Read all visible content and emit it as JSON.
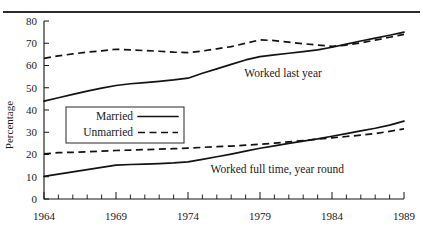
{
  "figure": {
    "title": "",
    "title_clipped": true,
    "has_top_rule": true
  },
  "chart_data": {
    "type": "line",
    "title": "",
    "xlabel": "",
    "ylabel": "Percentage",
    "xlim": [
      1964,
      1989
    ],
    "ylim": [
      0,
      80
    ],
    "grid": false,
    "legend_position": "center-left-inside",
    "x": [
      1964,
      1965,
      1966,
      1967,
      1968,
      1969,
      1970,
      1971,
      1972,
      1973,
      1974,
      1975,
      1976,
      1977,
      1978,
      1979,
      1980,
      1981,
      1982,
      1983,
      1984,
      1985,
      1986,
      1987,
      1988,
      1989
    ],
    "xticks": [
      1964,
      1969,
      1974,
      1979,
      1984,
      1989
    ],
    "xtick_labels": [
      "1964",
      "1969",
      "1974",
      "1979",
      "1984",
      "1989"
    ],
    "yticks": [
      0,
      10,
      20,
      30,
      40,
      50,
      60,
      70,
      80
    ],
    "ytick_labels": [
      "0",
      "10",
      "20",
      "30",
      "40",
      "50",
      "60",
      "70",
      "80"
    ],
    "series": [
      {
        "name": "Married",
        "group": "Worked last year",
        "style": "solid",
        "color": "#131313",
        "values": [
          44,
          45.5,
          47,
          48.5,
          49.8,
          51,
          51.8,
          52.3,
          52.9,
          53.5,
          54.3,
          56.5,
          58.5,
          60.5,
          62.5,
          64,
          64.8,
          65.5,
          66.2,
          67,
          68.2,
          69.6,
          71,
          72.3,
          73.6,
          75
        ]
      },
      {
        "name": "Unmarried",
        "group": "Worked last year",
        "style": "dashed",
        "color": "#131313",
        "values": [
          63.2,
          64.3,
          65.2,
          66,
          66.6,
          67.3,
          67,
          66.7,
          66.4,
          66,
          65.8,
          66.5,
          67.5,
          68.5,
          70,
          71.5,
          71.2,
          70.5,
          69.8,
          69.2,
          68.6,
          69.2,
          70.2,
          71.4,
          72.7,
          74
        ]
      },
      {
        "name": "Married",
        "group": "Worked full time, year round",
        "style": "solid",
        "color": "#131313",
        "values": [
          10.2,
          11.2,
          12.2,
          13.2,
          14.2,
          15.2,
          15.5,
          15.7,
          15.9,
          16.2,
          16.7,
          17.8,
          19,
          20.2,
          21.5,
          22.8,
          23.9,
          25,
          26,
          27,
          28.2,
          29.4,
          30.6,
          31.8,
          33.2,
          35
        ]
      },
      {
        "name": "Unmarried",
        "group": "Worked full time, year round",
        "style": "dashed",
        "color": "#131313",
        "values": [
          20.3,
          20.8,
          21,
          21.2,
          21.5,
          21.8,
          22,
          22.2,
          22.4,
          22.6,
          22.9,
          23.2,
          23.5,
          23.8,
          24.2,
          24.6,
          25.1,
          25.7,
          26.3,
          26.9,
          27.5,
          28.1,
          28.7,
          29.4,
          30.4,
          31.5
        ]
      }
    ],
    "annotations": [
      {
        "text": "Worked last year",
        "x": 1980.6,
        "y": 55
      },
      {
        "text": "Worked full time, year round",
        "x": 1980.2,
        "y": 11.5
      }
    ]
  },
  "legend": {
    "items": [
      {
        "label": "Married",
        "style": "solid"
      },
      {
        "label": "Unmarried",
        "style": "dashed"
      }
    ]
  },
  "axes": {
    "y_title": "Percentage"
  }
}
